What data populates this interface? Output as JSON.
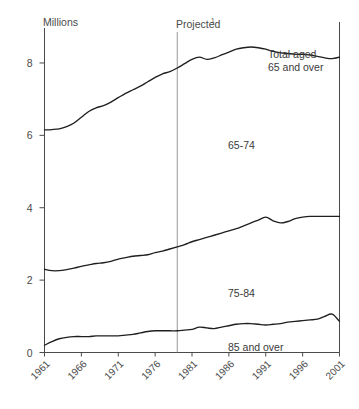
{
  "chart_data": {
    "type": "line",
    "title": "",
    "ylabel": "Millions",
    "xlabel": "",
    "ylim": [
      0,
      8.8
    ],
    "xlim": [
      1961,
      2001
    ],
    "yticks": [
      0,
      2,
      4,
      6,
      8
    ],
    "ytick_labels": [
      "0",
      "2",
      "4",
      "6",
      "8"
    ],
    "xticks": [
      1961,
      1966,
      1971,
      1976,
      1981,
      1986,
      1991,
      1996,
      2001
    ],
    "xtick_labels": [
      "1961",
      "1966",
      "1971",
      "1976",
      "1981",
      "1986",
      "1991",
      "1996",
      "2001"
    ],
    "grid": false,
    "legend_position": "inline-annotations",
    "projection_start_year": 1979,
    "annotations": [
      {
        "text": "Millions",
        "kind": "axis-unit"
      },
      {
        "text": "Projected",
        "superscript": "1",
        "kind": "region-label"
      },
      {
        "text": "Total aged",
        "kind": "series-label"
      },
      {
        "text": "65 and over",
        "kind": "series-label"
      },
      {
        "text": "65-74",
        "kind": "series-label"
      },
      {
        "text": "75-84",
        "kind": "series-label"
      },
      {
        "text": "85 and over",
        "kind": "series-label"
      }
    ],
    "x": [
      1961,
      1962,
      1963,
      1964,
      1965,
      1966,
      1967,
      1968,
      1969,
      1970,
      1971,
      1972,
      1973,
      1974,
      1975,
      1976,
      1977,
      1978,
      1979,
      1980,
      1981,
      1982,
      1983,
      1984,
      1985,
      1986,
      1987,
      1988,
      1989,
      1990,
      1991,
      1992,
      1993,
      1994,
      1995,
      1996,
      1997,
      1998,
      1999,
      2000,
      2001
    ],
    "series": [
      {
        "name": "Total aged 65 and over",
        "label": "Total aged 65 and over",
        "values": [
          6.15,
          6.16,
          6.18,
          6.24,
          6.34,
          6.5,
          6.66,
          6.76,
          6.82,
          6.92,
          7.04,
          7.16,
          7.26,
          7.36,
          7.48,
          7.6,
          7.7,
          7.76,
          7.86,
          7.98,
          8.1,
          8.16,
          8.1,
          8.14,
          8.22,
          8.3,
          8.38,
          8.42,
          8.44,
          8.42,
          8.38,
          8.32,
          8.28,
          8.26,
          8.24,
          8.24,
          8.22,
          8.18,
          8.14,
          8.12,
          8.16
        ]
      },
      {
        "name": "75-84 (cumulative upper boundary)",
        "label": "75-84",
        "values": [
          2.3,
          2.26,
          2.26,
          2.29,
          2.33,
          2.38,
          2.42,
          2.46,
          2.48,
          2.52,
          2.58,
          2.62,
          2.66,
          2.68,
          2.7,
          2.76,
          2.8,
          2.86,
          2.92,
          2.98,
          3.06,
          3.12,
          3.18,
          3.24,
          3.3,
          3.36,
          3.42,
          3.5,
          3.58,
          3.66,
          3.74,
          3.64,
          3.58,
          3.62,
          3.7,
          3.74,
          3.76,
          3.76,
          3.76,
          3.76,
          3.76
        ]
      },
      {
        "name": "85 and over",
        "label": "85 and over",
        "values": [
          0.2,
          0.3,
          0.38,
          0.42,
          0.44,
          0.44,
          0.44,
          0.46,
          0.46,
          0.46,
          0.46,
          0.48,
          0.5,
          0.54,
          0.58,
          0.6,
          0.6,
          0.6,
          0.6,
          0.62,
          0.64,
          0.7,
          0.68,
          0.66,
          0.7,
          0.74,
          0.78,
          0.8,
          0.8,
          0.78,
          0.76,
          0.78,
          0.8,
          0.84,
          0.86,
          0.88,
          0.9,
          0.92,
          1.0,
          1.06,
          0.86
        ]
      }
    ]
  },
  "axis": {
    "unit_label": "Millions",
    "projected_label": "Projected",
    "projected_superscript": "1"
  },
  "labels": {
    "total_line1": "Total aged",
    "total_line2": "65 and over",
    "band_65_74": "65-74",
    "band_75_84": "75-84",
    "band_85_over": "85 and over"
  },
  "colors": {
    "background": "#ffffff",
    "line": "#1f1f1f",
    "axis": "#4a4a4a",
    "projected_divider": "#8a8a8a",
    "text": "#3b3b3b"
  }
}
